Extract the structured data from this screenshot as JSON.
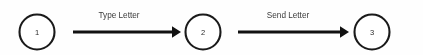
{
  "diagram": {
    "type": "state-transition-diagram",
    "background_color": "#fefefe",
    "stroke_color": "#111111",
    "text_color": "#3a3a3a",
    "nodes": [
      {
        "id": "node-1",
        "label": "1",
        "cx": 37,
        "cy": 32,
        "r": 17.5
      },
      {
        "id": "node-2",
        "label": "2",
        "cx": 203,
        "cy": 32,
        "r": 17.5
      },
      {
        "id": "node-3",
        "label": "3",
        "cx": 372,
        "cy": 32,
        "r": 17.5
      }
    ],
    "edges": [
      {
        "id": "edge-type-letter",
        "label": "Type Letter",
        "from": "node-1",
        "to": "node-2",
        "x1": 73,
        "x2": 181,
        "y": 32,
        "label_x": 119,
        "label_y": 18
      },
      {
        "id": "edge-send-letter",
        "label": "Send Letter",
        "from": "node-2",
        "to": "node-3",
        "x1": 238,
        "x2": 349,
        "y": 32,
        "label_x": 288,
        "label_y": 18
      }
    ]
  }
}
